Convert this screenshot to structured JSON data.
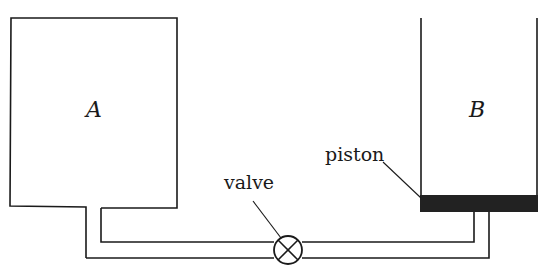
{
  "diagram": {
    "type": "physics-apparatus",
    "containers": [
      {
        "id": "A",
        "label": "A",
        "kind": "rigid tank"
      },
      {
        "id": "B",
        "label": "B",
        "kind": "open cylinder with piston"
      }
    ],
    "labels": {
      "container_a": "A",
      "container_b": "B",
      "piston": "piston",
      "valve": "valve"
    },
    "connections": [
      {
        "from": "A",
        "to": "B",
        "via": "pipe with valve",
        "enters_b": "through piston from below"
      }
    ],
    "colors": {
      "line": "#1a1a1a",
      "piston": "#222222",
      "background": "#ffffff"
    }
  }
}
